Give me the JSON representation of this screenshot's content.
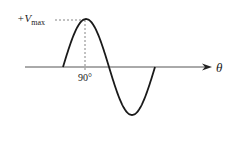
{
  "diagram": {
    "type": "sine-wave-one-cycle",
    "peak_label": {
      "prefix": "+V",
      "subscript": "max"
    },
    "phase_label": "90°",
    "axis_label": "θ",
    "colors": {
      "curve": "#1a1a1a",
      "axis": "#555555",
      "dashed": "#666666"
    }
  }
}
